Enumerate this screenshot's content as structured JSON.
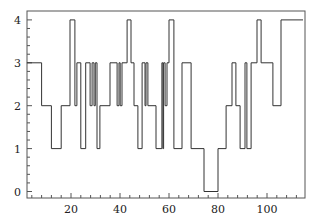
{
  "chart_data": {
    "type": "line",
    "subtype": "step",
    "title": "",
    "xlabel": "",
    "ylabel": "",
    "xlim": [
      2,
      115.5
    ],
    "ylim": [
      -0.15,
      4.2
    ],
    "grid": false,
    "legend": null,
    "xticks": [
      20,
      40,
      60,
      80,
      100
    ],
    "yticks": [
      0,
      1,
      2,
      3,
      4
    ],
    "series": [
      {
        "name": "state",
        "color": "#333333",
        "steps": [
          {
            "x": 2,
            "y": 3
          },
          {
            "x": 8,
            "y": 2
          },
          {
            "x": 12,
            "y": 1
          },
          {
            "x": 16,
            "y": 2
          },
          {
            "x": 19.6,
            "y": 4
          },
          {
            "x": 21.6,
            "y": 2
          },
          {
            "x": 22.4,
            "y": 3
          },
          {
            "x": 24,
            "y": 1
          },
          {
            "x": 26,
            "y": 3
          },
          {
            "x": 27.8,
            "y": 2
          },
          {
            "x": 28.6,
            "y": 3
          },
          {
            "x": 29.4,
            "y": 2
          },
          {
            "x": 29.9,
            "y": 3
          },
          {
            "x": 30.6,
            "y": 1
          },
          {
            "x": 31.8,
            "y": 2
          },
          {
            "x": 35.9,
            "y": 3
          },
          {
            "x": 38.8,
            "y": 2
          },
          {
            "x": 39.6,
            "y": 3
          },
          {
            "x": 40.1,
            "y": 2
          },
          {
            "x": 40.8,
            "y": 3
          },
          {
            "x": 42.9,
            "y": 4
          },
          {
            "x": 44.5,
            "y": 3
          },
          {
            "x": 45.7,
            "y": 2
          },
          {
            "x": 47.3,
            "y": 1
          },
          {
            "x": 49,
            "y": 3
          },
          {
            "x": 50.2,
            "y": 2
          },
          {
            "x": 50.6,
            "y": 3
          },
          {
            "x": 51.4,
            "y": 2
          },
          {
            "x": 54.7,
            "y": 1
          },
          {
            "x": 57.1,
            "y": 3
          },
          {
            "x": 57.5,
            "y": 1
          },
          {
            "x": 57.8,
            "y": 3
          },
          {
            "x": 58.4,
            "y": 2
          },
          {
            "x": 59.2,
            "y": 3
          },
          {
            "x": 60,
            "y": 4
          },
          {
            "x": 62,
            "y": 1
          },
          {
            "x": 65.3,
            "y": 3
          },
          {
            "x": 69,
            "y": 1
          },
          {
            "x": 74.3,
            "y": 0
          },
          {
            "x": 80,
            "y": 1
          },
          {
            "x": 83.3,
            "y": 2
          },
          {
            "x": 85.7,
            "y": 3
          },
          {
            "x": 87.3,
            "y": 2
          },
          {
            "x": 89,
            "y": 1
          },
          {
            "x": 91,
            "y": 3
          },
          {
            "x": 91.8,
            "y": 1
          },
          {
            "x": 93.5,
            "y": 3
          },
          {
            "x": 95.9,
            "y": 4
          },
          {
            "x": 97.6,
            "y": 3
          },
          {
            "x": 102.4,
            "y": 2
          },
          {
            "x": 105.7,
            "y": 4
          },
          {
            "x": 114.7,
            "y": 4
          }
        ]
      }
    ]
  },
  "layout": {
    "plot_left_px": 27,
    "plot_right_px": 305,
    "plot_top_px": 11,
    "plot_bottom_px": 198,
    "x_origin_px": 22,
    "x_px_per_unit": 2.45,
    "y_zero_px": 191.5,
    "y_px_per_unit": 42.9
  },
  "labels": {
    "x": [
      "20",
      "40",
      "60",
      "80",
      "100"
    ],
    "y": [
      "0",
      "1",
      "2",
      "3",
      "4"
    ]
  }
}
